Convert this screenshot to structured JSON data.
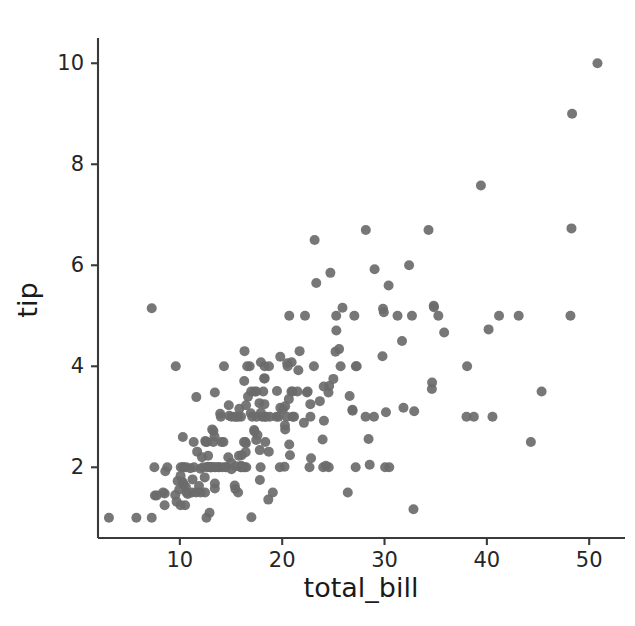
{
  "figure": {
    "background_color": "#ffffff",
    "marker_color": "#6b6b6b",
    "axis_color": "#3a3a3a",
    "text_color": "#262626"
  },
  "chart_data": {
    "type": "scatter",
    "title": "",
    "xlabel": "total_bill",
    "ylabel": "tip",
    "xlim": [
      2.0,
      53.5
    ],
    "ylim": [
      0.6,
      10.5
    ],
    "xticks": [
      10,
      20,
      30,
      40,
      50
    ],
    "yticks": [
      2,
      4,
      6,
      8,
      10
    ],
    "xtick_labels": [
      "10",
      "20",
      "30",
      "40",
      "50"
    ],
    "ytick_labels": [
      "2",
      "4",
      "6",
      "8",
      "10"
    ],
    "grid": false,
    "legend": null,
    "n_points": 244,
    "marker": "circle",
    "marker_size": 10,
    "series": [
      {
        "name": "tips",
        "x": [
          16.99,
          10.34,
          21.01,
          23.68,
          24.59,
          25.29,
          8.77,
          26.88,
          15.04,
          14.78,
          10.27,
          35.26,
          15.42,
          18.43,
          14.83,
          21.58,
          10.33,
          16.29,
          16.97,
          20.65,
          17.92,
          20.29,
          15.77,
          39.42,
          19.82,
          17.81,
          13.37,
          12.69,
          21.7,
          19.65,
          9.55,
          18.35,
          15.06,
          20.69,
          17.78,
          24.06,
          16.31,
          16.93,
          18.69,
          31.27,
          16.04,
          17.46,
          13.94,
          9.68,
          30.4,
          18.29,
          22.23,
          32.4,
          28.55,
          18.04,
          12.54,
          10.29,
          34.81,
          9.94,
          25.56,
          19.49,
          38.01,
          26.41,
          11.24,
          48.27,
          20.29,
          13.81,
          11.02,
          18.29,
          17.59,
          20.08,
          16.45,
          3.07,
          20.23,
          15.01,
          12.02,
          17.07,
          26.86,
          25.28,
          14.73,
          10.51,
          17.92,
          27.2,
          22.76,
          17.29,
          19.44,
          16.66,
          10.07,
          32.68,
          15.98,
          34.83,
          13.03,
          18.28,
          24.71,
          21.16,
          28.97,
          22.49,
          5.75,
          16.32,
          22.75,
          40.17,
          27.28,
          12.03,
          21.01,
          12.46,
          11.35,
          15.38,
          44.3,
          22.42,
          20.92,
          15.36,
          20.49,
          25.21,
          18.24,
          14.31,
          14.0,
          7.25,
          38.07,
          23.95,
          25.71,
          17.31,
          29.93,
          10.65,
          12.43,
          24.08,
          11.69,
          13.42,
          14.26,
          15.95,
          12.48,
          29.8,
          8.52,
          14.52,
          11.38,
          22.82,
          19.08,
          20.27,
          11.17,
          12.26,
          18.26,
          8.51,
          10.33,
          14.15,
          16.0,
          13.16,
          17.47,
          34.3,
          41.19,
          27.05,
          16.43,
          8.35,
          18.64,
          11.87,
          9.78,
          7.51,
          14.07,
          13.13,
          17.26,
          24.55,
          19.77,
          29.85,
          48.17,
          25.0,
          13.39,
          16.49,
          21.5,
          12.66,
          16.21,
          13.81,
          17.51,
          24.52,
          20.76,
          31.71,
          10.59,
          10.63,
          50.81,
          15.81,
          7.25,
          31.85,
          16.82,
          32.9,
          17.89,
          14.48,
          9.6,
          34.63,
          34.65,
          23.33,
          45.35,
          23.17,
          40.55,
          20.69,
          20.9,
          30.46,
          18.15,
          23.1,
          15.69,
          19.81,
          28.44,
          15.48,
          16.58,
          7.56,
          10.34,
          43.11,
          13.0,
          13.51,
          18.71,
          12.74,
          13.0,
          16.4,
          20.53,
          16.47,
          26.59,
          38.73,
          24.27,
          12.76,
          30.06,
          25.89,
          48.33,
          13.27,
          28.17,
          12.9,
          28.15,
          11.59,
          7.74,
          30.14,
          12.16,
          13.42,
          8.58,
          15.98,
          13.42,
          16.27,
          10.09,
          20.45,
          13.28,
          22.12,
          24.01,
          15.69,
          11.61,
          10.77,
          15.53,
          10.07,
          12.6,
          32.83,
          35.83,
          29.03,
          27.18,
          22.67,
          17.82,
          18.78
        ],
        "y": [
          1.01,
          1.66,
          3.5,
          3.31,
          3.61,
          4.71,
          2.0,
          3.12,
          1.96,
          3.23,
          1.71,
          5.0,
          1.57,
          3.0,
          3.02,
          3.92,
          1.67,
          3.71,
          3.5,
          3.35,
          4.08,
          2.75,
          2.23,
          7.58,
          3.18,
          2.34,
          2.0,
          2.0,
          4.3,
          3.0,
          1.45,
          2.5,
          3.0,
          2.45,
          3.27,
          3.6,
          2.0,
          3.07,
          2.31,
          5.0,
          2.24,
          2.54,
          3.06,
          1.32,
          5.6,
          3.0,
          5.0,
          6.0,
          2.05,
          3.0,
          2.5,
          2.6,
          5.2,
          1.56,
          4.34,
          3.51,
          3.0,
          1.5,
          1.76,
          6.73,
          3.21,
          2.0,
          1.98,
          3.76,
          2.64,
          3.15,
          2.47,
          1.0,
          2.01,
          2.09,
          1.97,
          3.0,
          3.14,
          5.0,
          2.2,
          1.25,
          3.08,
          4.0,
          3.0,
          2.71,
          3.0,
          3.4,
          1.83,
          5.0,
          2.03,
          5.17,
          2.0,
          4.0,
          5.85,
          3.0,
          3.0,
          3.5,
          1.0,
          4.3,
          3.25,
          4.73,
          4.0,
          1.5,
          3.0,
          1.5,
          2.5,
          3.0,
          2.5,
          3.48,
          4.08,
          1.64,
          4.06,
          4.29,
          3.76,
          4.0,
          3.0,
          1.0,
          4.0,
          2.55,
          4.0,
          3.5,
          5.07,
          1.5,
          1.8,
          2.92,
          2.31,
          1.68,
          2.5,
          2.0,
          2.52,
          4.2,
          1.48,
          2.0,
          2.0,
          2.18,
          1.5,
          2.83,
          1.5,
          2.0,
          3.25,
          1.25,
          2.0,
          2.0,
          2.0,
          2.75,
          3.5,
          6.7,
          5.0,
          5.0,
          2.3,
          1.5,
          1.36,
          1.63,
          1.73,
          2.0,
          2.5,
          2.0,
          2.74,
          2.0,
          2.0,
          5.14,
          5.0,
          3.75,
          2.61,
          2.0,
          3.5,
          2.5,
          2.0,
          2.0,
          3.0,
          3.48,
          2.24,
          4.5,
          1.61,
          2.0,
          10.0,
          3.16,
          5.15,
          3.18,
          4.0,
          3.11,
          2.0,
          2.0,
          4.0,
          3.55,
          3.68,
          5.65,
          3.5,
          6.5,
          3.0,
          5.0,
          3.5,
          2.0,
          3.5,
          4.0,
          1.5,
          4.19,
          2.56,
          2.02,
          4.0,
          1.44,
          2.0,
          5.0,
          2.0,
          2.0,
          4.0,
          2.01,
          2.0,
          2.5,
          4.0,
          3.23,
          3.41,
          3.0,
          2.03,
          2.23,
          2.0,
          5.16,
          9.0,
          2.5,
          6.7,
          1.1,
          3.0,
          1.5,
          1.44,
          3.09,
          2.2,
          3.48,
          1.92,
          3.0,
          1.58,
          2.5,
          2.0,
          3.0,
          2.72,
          2.88,
          2.0,
          3.0,
          3.39,
          1.47,
          3.0,
          1.25,
          1.0,
          1.17,
          4.67,
          5.92,
          2.0,
          2.0,
          1.75,
          3.0
        ]
      }
    ]
  }
}
